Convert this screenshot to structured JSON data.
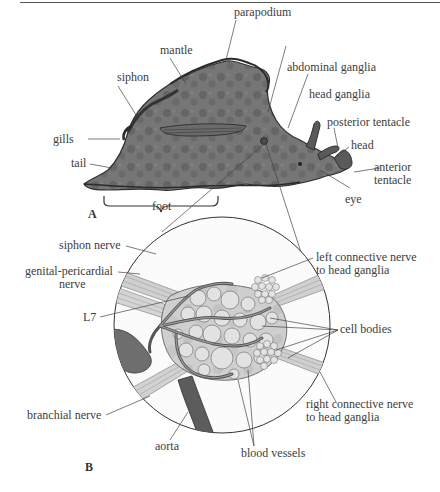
{
  "figure": {
    "panel_a": {
      "letter": "A",
      "labels": {
        "parapodium": "parapodium",
        "mantle": "mantle",
        "siphon": "siphon",
        "abdominal_ganglia": "abdominal ganglia",
        "head_ganglia": "head ganglia",
        "posterior_tentacle": "posterior tentacle",
        "head": "head",
        "anterior_tentacle_1": "anterior",
        "anterior_tentacle_2": "tentacle",
        "gills": "gills",
        "tail": "tail",
        "foot": "foot",
        "eye": "eye"
      }
    },
    "panel_b": {
      "letter": "B",
      "labels": {
        "siphon_nerve": "siphon nerve",
        "genital_pericardial_1": "genital-pericardial",
        "genital_pericardial_2": "nerve",
        "l7": "L7",
        "left_connective_1": "left connective nerve",
        "left_connective_2": "to head ganglia",
        "cell_bodies": "cell bodies",
        "right_connective_1": "right connective nerve",
        "right_connective_2": "to head ganglia",
        "branchial_nerve": "branchial nerve",
        "aorta": "aorta",
        "blood_vessels": "blood vessels"
      }
    },
    "colors": {
      "body": "#6f6f6f",
      "body_dark": "#4a4a4a",
      "ganglion": "#c9c9c9",
      "cell": "#dedede",
      "line": "#444444"
    }
  }
}
